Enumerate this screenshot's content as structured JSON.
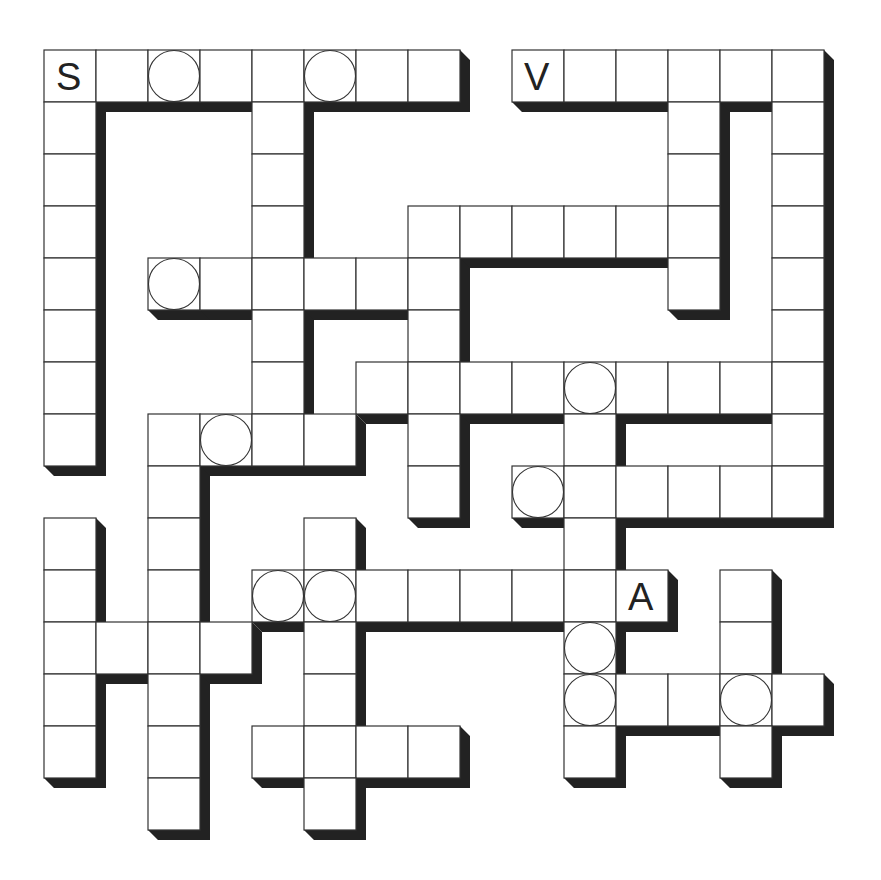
{
  "puzzle": {
    "type": "crossword-grid",
    "rows": 15,
    "cols": 15,
    "colors": {
      "cell_fill": "#ffffff",
      "cell_border": "#333333",
      "shadow": "#222222",
      "background": "#ffffff"
    },
    "entries": [
      {
        "dir": "across",
        "row": 0,
        "col": 0,
        "length": 8
      },
      {
        "dir": "across",
        "row": 0,
        "col": 9,
        "length": 6
      },
      {
        "dir": "down",
        "row": 0,
        "col": 0,
        "length": 8
      },
      {
        "dir": "down",
        "row": 0,
        "col": 4,
        "length": 8
      },
      {
        "dir": "down",
        "row": 0,
        "col": 12,
        "length": 5
      },
      {
        "dir": "down",
        "row": 0,
        "col": 14,
        "length": 9
      },
      {
        "dir": "across",
        "row": 3,
        "col": 7,
        "length": 6
      },
      {
        "dir": "across",
        "row": 4,
        "col": 2,
        "length": 6
      },
      {
        "dir": "down",
        "row": 3,
        "col": 7,
        "length": 6
      },
      {
        "dir": "across",
        "row": 6,
        "col": 6,
        "length": 8
      },
      {
        "dir": "across",
        "row": 7,
        "col": 2,
        "length": 4
      },
      {
        "dir": "down",
        "row": 7,
        "col": 2,
        "length": 8
      },
      {
        "dir": "across",
        "row": 8,
        "col": 9,
        "length": 6
      },
      {
        "dir": "down",
        "row": 6,
        "col": 10,
        "length": 8
      },
      {
        "dir": "down",
        "row": 9,
        "col": 0,
        "length": 5
      },
      {
        "dir": "across",
        "row": 11,
        "col": 0,
        "length": 4
      },
      {
        "dir": "down",
        "row": 9,
        "col": 5,
        "length": 6
      },
      {
        "dir": "across",
        "row": 10,
        "col": 4,
        "length": 8
      },
      {
        "dir": "across",
        "row": 13,
        "col": 4,
        "length": 4
      },
      {
        "dir": "across",
        "row": 12,
        "col": 10,
        "length": 5
      },
      {
        "dir": "down",
        "row": 10,
        "col": 13,
        "length": 4
      }
    ],
    "circled_cells": [
      [
        0,
        2
      ],
      [
        0,
        5
      ],
      [
        4,
        2
      ],
      [
        6,
        10
      ],
      [
        7,
        3
      ],
      [
        8,
        9
      ],
      [
        10,
        4
      ],
      [
        10,
        5
      ],
      [
        11,
        10
      ],
      [
        12,
        10
      ],
      [
        12,
        13
      ]
    ],
    "given_letters": [
      {
        "row": 0,
        "col": 0,
        "letter": "S"
      },
      {
        "row": 0,
        "col": 9,
        "letter": "V"
      },
      {
        "row": 10,
        "col": 11,
        "letter": "A"
      }
    ]
  }
}
